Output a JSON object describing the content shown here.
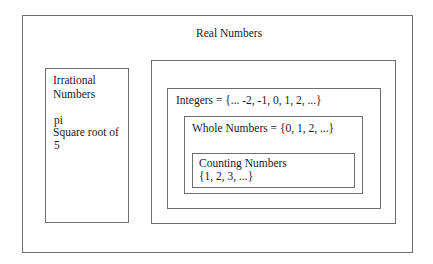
{
  "diagram": {
    "type": "nested-sets",
    "title": "Real Numbers",
    "sets": {
      "real": {
        "label": "Real Numbers"
      },
      "irrational": {
        "label_line1": "Irrational",
        "label_line2": "Numbers",
        "examples": [
          "pi",
          "Square root of",
          "5"
        ]
      },
      "rational": {
        "label": ""
      },
      "integers": {
        "label": "Integers = {... -2, -1, 0, 1, 2, ...}"
      },
      "whole": {
        "label": "Whole Numbers = {0, 1, 2, ...}"
      },
      "counting": {
        "label_line1": "Counting Numbers",
        "label_line2": "{1, 2, 3, ...}"
      }
    },
    "colors": {
      "border": "#6e6e6e",
      "text": "#1a1a1a",
      "background": "#ffffff"
    }
  }
}
